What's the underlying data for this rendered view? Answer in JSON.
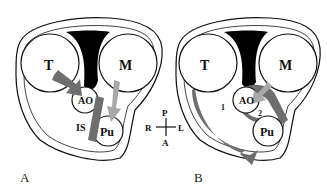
{
  "panels": [
    {
      "id": "A",
      "label": "A",
      "structures": {
        "tricuspid": "T",
        "mitral": "M",
        "aorta": "AO",
        "pulmonary": "Pu",
        "infundibular_septum": "IS"
      }
    },
    {
      "id": "B",
      "label": "B",
      "structures": {
        "tricuspid": "T",
        "mitral": "M",
        "aorta": "AO",
        "pulmonary": "Pu"
      },
      "markers": [
        "1",
        "2"
      ]
    }
  ],
  "orientation": {
    "posterior": "P",
    "right": "R",
    "left": "L",
    "anterior": "A"
  },
  "colors": {
    "outline": "#111111",
    "dark_arrow": "#6e6e6e",
    "light_arrow": "#a8a8a8",
    "fill": "#000000"
  }
}
